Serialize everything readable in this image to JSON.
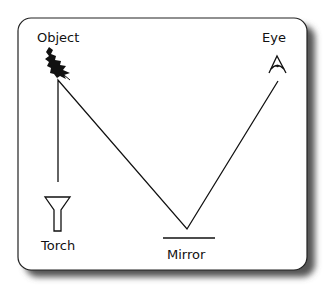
{
  "diagram": {
    "labels": {
      "object": "Object",
      "eye": "Eye",
      "torch": "Torch",
      "mirror": "Mirror"
    },
    "icons": {
      "object": "holly-leaf-icon",
      "eye": "eye-icon",
      "torch": "torch-icon",
      "mirror": "mirror-line"
    },
    "colors": {
      "stroke": "#111111",
      "background": "#ffffff",
      "shadow": "#555555"
    }
  }
}
